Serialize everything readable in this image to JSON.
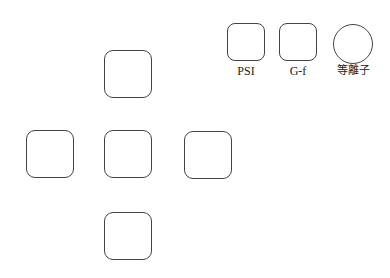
{
  "diagram": {
    "cross": {
      "boxes": [
        {
          "position": "top"
        },
        {
          "position": "left"
        },
        {
          "position": "center"
        },
        {
          "position": "right"
        },
        {
          "position": "bottom"
        }
      ]
    },
    "legend": {
      "items": [
        {
          "shape": "rounded-square",
          "label": "PSI"
        },
        {
          "shape": "rounded-square",
          "label": "G-f"
        },
        {
          "shape": "circle",
          "label": "等離子"
        }
      ]
    },
    "colors": {
      "stroke": "#444444",
      "background": "#ffffff",
      "text": "#222222"
    }
  }
}
